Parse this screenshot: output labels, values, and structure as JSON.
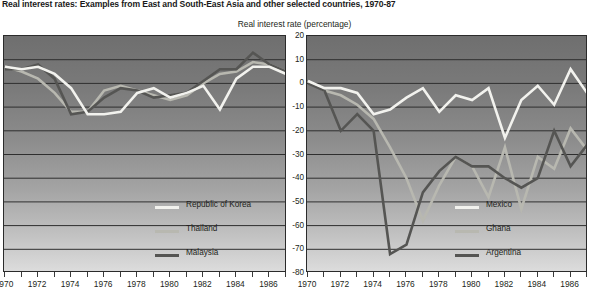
{
  "title": "Real interest rates: Examples from East and South-East Asia and other selected countries, 1970-87",
  "axis_caption": "Real interest rate (percentage)",
  "legend_left": [
    {
      "label": "Republic of Korea",
      "color": "#f2f2ee"
    },
    {
      "label": "Thailand",
      "color": "#b8b8b0"
    },
    {
      "label": "Malaysia",
      "color": "#555553"
    }
  ],
  "legend_right": [
    {
      "label": "Mexico",
      "color": "#f2f2ee"
    },
    {
      "label": "Ghana",
      "color": "#b8b8b0"
    },
    {
      "label": "Argentina",
      "color": "#555553"
    }
  ],
  "chart_data": [
    {
      "type": "line",
      "title": "Real interest rates: Examples from East and South-East Asia and other selected countries, 1970-87",
      "panel": "left",
      "xlabel": "",
      "ylabel": "Real interest rate (percentage)",
      "ylim": [
        -80,
        20
      ],
      "yticks": [
        20,
        10,
        0,
        -10,
        -20,
        -30,
        -40,
        -50,
        -60,
        -70,
        -80
      ],
      "xlim": [
        1970,
        1987
      ],
      "xticks": [
        1970,
        1971,
        1972,
        1973,
        1974,
        1975,
        1976,
        1977,
        1978,
        1979,
        1980,
        1981,
        1982,
        1983,
        1984,
        1985,
        1986,
        1987
      ],
      "xticklabels": [
        "1970",
        "",
        "1972",
        "",
        "1974",
        "",
        "1976",
        "",
        "1978",
        "",
        "1980",
        "",
        "1982",
        "",
        "1984",
        "",
        "1986",
        ""
      ],
      "grid": true,
      "legend_position": "inside-bottom-center",
      "x": [
        1970,
        1971,
        1972,
        1973,
        1974,
        1975,
        1976,
        1977,
        1978,
        1979,
        1980,
        1981,
        1982,
        1983,
        1984,
        1985,
        1986,
        1987
      ],
      "series": [
        {
          "name": "Republic of Korea",
          "color": "#f2f2ee",
          "values": [
            7,
            6,
            7,
            4,
            -2,
            -13,
            -13,
            -12,
            -4,
            -2,
            -6,
            -4,
            -1,
            -11,
            2,
            7,
            7,
            4
          ]
        },
        {
          "name": "Thailand",
          "color": "#b8b8b0",
          "values": [
            7,
            5,
            2,
            -4,
            -12,
            -12,
            -3,
            -1,
            -3,
            -5,
            -7,
            -5,
            0,
            4,
            5,
            9,
            8,
            5
          ]
        },
        {
          "name": "Malaysia",
          "color": "#555553",
          "values": [
            6,
            6,
            8,
            2,
            -13,
            -12,
            -6,
            -2,
            -3,
            -6,
            -5,
            -4,
            1,
            6,
            6,
            13,
            8,
            5
          ]
        }
      ]
    },
    {
      "type": "line",
      "panel": "right",
      "xlabel": "",
      "ylabel": "Real interest rate (percentage)",
      "ylim": [
        -80,
        20
      ],
      "yticks": [
        20,
        10,
        0,
        -10,
        -20,
        -30,
        -40,
        -50,
        -60,
        -70,
        -80
      ],
      "xlim": [
        1970,
        1987
      ],
      "xticks": [
        1970,
        1971,
        1972,
        1973,
        1974,
        1975,
        1976,
        1977,
        1978,
        1979,
        1980,
        1981,
        1982,
        1983,
        1984,
        1985,
        1986,
        1987
      ],
      "xticklabels": [
        "1970",
        "",
        "1972",
        "",
        "1974",
        "",
        "1976",
        "",
        "1978",
        "",
        "1980",
        "",
        "1982",
        "",
        "1984",
        "",
        "1986",
        ""
      ],
      "grid": true,
      "legend_position": "inside-bottom-right",
      "x": [
        1970,
        1971,
        1972,
        1973,
        1974,
        1975,
        1976,
        1977,
        1978,
        1979,
        1980,
        1981,
        1982,
        1983,
        1984,
        1985,
        1986,
        1987
      ],
      "series": [
        {
          "name": "Mexico",
          "color": "#f2f2ee",
          "values": [
            1,
            -2,
            -2,
            -4,
            -13,
            -11,
            -6,
            -2,
            -12,
            -5,
            -7,
            -2,
            -23,
            -7,
            -1,
            -9,
            6,
            -4
          ]
        },
        {
          "name": "Ghana",
          "color": "#b8b8b0",
          "values": [
            1,
            -3,
            -5,
            -9,
            -15,
            -27,
            -40,
            -58,
            -43,
            -31,
            -35,
            -48,
            -27,
            -53,
            -31,
            -36,
            -19,
            -28
          ]
        },
        {
          "name": "Argentina",
          "color": "#555553",
          "values": [
            0,
            -3,
            -20,
            -13,
            -20,
            -72,
            -68,
            -46,
            -37,
            -31,
            -35,
            -35,
            -40,
            -44,
            -40,
            -20,
            -35,
            -26
          ]
        }
      ]
    }
  ]
}
